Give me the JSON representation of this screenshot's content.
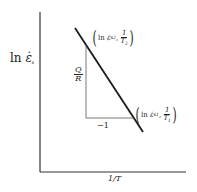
{
  "diagram": {
    "type": "arrhenius-plot",
    "y_axis_label": "ln ε̇s",
    "y_axis_label_parts": {
      "prefix": "ln",
      "symbol": "ε̇",
      "subscript": "s"
    },
    "x_axis_label": "1/T",
    "slope_rise_label": {
      "numerator": "Q",
      "denominator": "R"
    },
    "slope_run_label": "−1",
    "point_upper": {
      "prefix": "ln",
      "symbol": "ε̇",
      "subscript": "s2",
      "frac_num": "1",
      "frac_den": "T",
      "frac_den_sub": "2"
    },
    "point_lower": {
      "prefix": "ln",
      "symbol": "ε̇",
      "subscript": "s1",
      "frac_num": "1",
      "frac_den": "T",
      "frac_den_sub": "1"
    },
    "line_color": "#1a1a1a",
    "axis_color": "#333333"
  }
}
